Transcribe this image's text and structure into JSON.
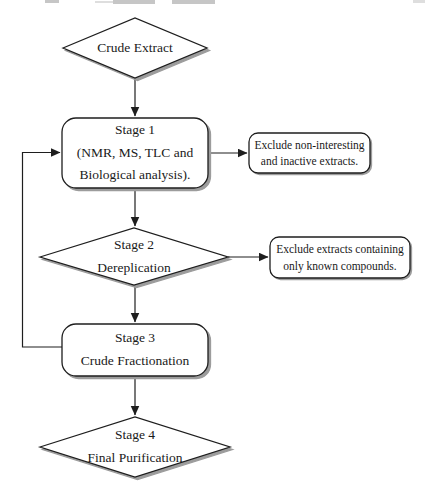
{
  "flowchart": {
    "description": "Natural product extract purification workflow flowchart",
    "colors": {
      "background": "#ffffff",
      "shape_fill": "#ffffff",
      "outline": "#1e1e1e",
      "shadow": "#9c9c9c",
      "text": "#1a1a1a"
    },
    "nodes": {
      "crude_extract": {
        "shape": "diamond",
        "label": "Crude Extract"
      },
      "stage1": {
        "shape": "rounded-rectangle",
        "label": "Stage 1\n(NMR, MS, TLC and\nBiological analysis)."
      },
      "exclude_noninteresting": {
        "shape": "rounded-rectangle",
        "label": "Exclude non-interesting\nand inactive extracts."
      },
      "stage2": {
        "shape": "diamond",
        "label": "Stage 2\nDereplication"
      },
      "exclude_known": {
        "shape": "rounded-rectangle",
        "label": "Exclude extracts containing\nonly known compounds."
      },
      "stage3": {
        "shape": "rounded-rectangle",
        "label": "Stage 3\nCrude Fractionation"
      },
      "stage4": {
        "shape": "diamond",
        "label": "Stage 4\nFinal Purification"
      }
    },
    "edges": [
      {
        "from": "crude_extract",
        "to": "stage1",
        "type": "arrow-down"
      },
      {
        "from": "stage1",
        "to": "exclude_noninteresting",
        "type": "arrow-right"
      },
      {
        "from": "stage1",
        "to": "stage2",
        "type": "arrow-down"
      },
      {
        "from": "stage2",
        "to": "exclude_known",
        "type": "arrow-right"
      },
      {
        "from": "stage2",
        "to": "stage3",
        "type": "arrow-down"
      },
      {
        "from": "stage3",
        "to": "stage4",
        "type": "arrow-down"
      },
      {
        "from": "stage3",
        "to": "stage1",
        "type": "feedback-loop-left"
      }
    ]
  }
}
